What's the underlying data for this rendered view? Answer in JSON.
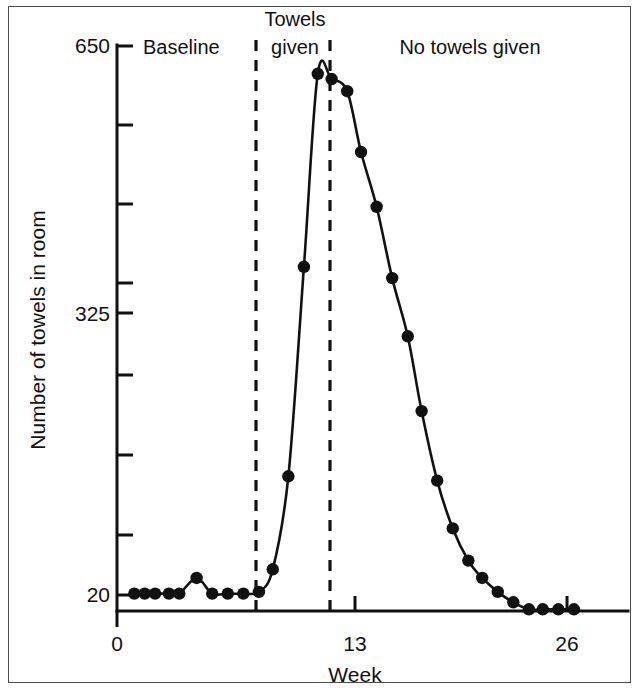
{
  "chart_data": {
    "type": "line",
    "title": "",
    "xlabel": "Week",
    "ylabel": "Number of towels in room",
    "xlim": [
      0,
      28
    ],
    "ylim": [
      0,
      650
    ],
    "xticks": [
      0,
      13,
      26
    ],
    "xticklabels": [
      "0",
      "13",
      "26"
    ],
    "yticks": [
      20,
      325,
      650
    ],
    "yticklabels": [
      "20",
      "325",
      "650"
    ],
    "minor_yticks": [
      98,
      176,
      247,
      403,
      481,
      559
    ],
    "grid": false,
    "legend": false,
    "series": [
      {
        "name": "Number of towels in room",
        "x": [
          1,
          1.6,
          2.2,
          3.0,
          3.6,
          4.6,
          5.5,
          6.4,
          7.3,
          8.2,
          9.0,
          9.9,
          10.8,
          11.6,
          12.4,
          13.3,
          14.1,
          15.0,
          15.9,
          16.8,
          17.6,
          18.5,
          19.4,
          20.3,
          21.1,
          22.0,
          22.9,
          23.8,
          24.6,
          25.5,
          26.4
        ],
        "y": [
          20,
          20,
          20,
          20,
          20,
          38,
          20,
          20,
          20,
          22,
          48,
          155,
          396,
          618,
          612,
          598,
          528,
          465,
          383,
          316,
          230,
          150,
          95,
          58,
          38,
          22,
          10,
          2,
          2,
          2,
          2
        ],
        "marker": "filled-circle",
        "linestyle": "solid",
        "color": "#111111"
      }
    ],
    "annotations": [
      {
        "id": "phase-baseline",
        "text": "Baseline",
        "x_week": 3.6,
        "align": "left"
      },
      {
        "id": "phase-towels-given",
        "text": "Towels\ngiven",
        "line1": "Towels",
        "line2": "given",
        "x_week": 9.0,
        "align": "center"
      },
      {
        "id": "phase-no-towels-given",
        "text": "No towels given",
        "x_week": 20.5,
        "align": "center"
      }
    ],
    "phase_dividers": [
      {
        "id": "divider-baseline-end",
        "x_week": 7.9
      },
      {
        "id": "divider-intervention-end",
        "x_week": 12.2
      }
    ]
  },
  "axes": {
    "y_label": "Number of towels in room",
    "x_label": "Week",
    "y_tick_650": "650",
    "y_tick_325": "325",
    "y_tick_20": "20",
    "x_tick_0": "0",
    "x_tick_13": "13",
    "x_tick_26": "26"
  },
  "phases": {
    "baseline": "Baseline",
    "towels_given_line1": "Towels",
    "towels_given_line2": "given",
    "no_towels_given": "No towels given"
  },
  "style": {
    "ink": "#111111",
    "frame": "#4a4a4a",
    "background": "#ffffff"
  }
}
